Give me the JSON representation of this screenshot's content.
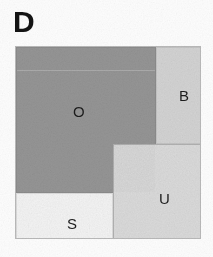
{
  "figure": {
    "panel_label": "D",
    "width": 213,
    "height": 257,
    "background_color": "#fdfdfd",
    "border_color": "#b9b9b9"
  },
  "chart_data": {
    "type": "treemap",
    "title": "D",
    "xlabel": "",
    "ylabel": "",
    "grid": false,
    "legend_position": "none",
    "plot_area": {
      "x": 15,
      "y": 46,
      "width": 186,
      "height": 193
    },
    "categories": [
      "O",
      "B",
      "U",
      "S"
    ],
    "values": [
      54.8,
      12.4,
      23.8,
      12.7
    ],
    "value_unit": "percent of area",
    "series": [
      {
        "name": "area share",
        "values": [
          54.8,
          12.4,
          23.8,
          12.7
        ]
      }
    ],
    "tiles": [
      {
        "label": "O",
        "value": 54.8,
        "color": "#969696",
        "border_color": "#8b8b8b",
        "x": 0,
        "y": 0,
        "width": 140,
        "height": 146,
        "label_x": 56,
        "label_y": 56
      },
      {
        "label": "B",
        "value": 12.4,
        "color": "#d5d5d5",
        "border_color": "#c2c2c2",
        "x": 140,
        "y": 0,
        "width": 46,
        "height": 97,
        "label_x": 22,
        "label_y": 40
      },
      {
        "label": "U",
        "value": 23.8,
        "color": "#dcdcdc",
        "border_color": "#b0b0b0",
        "x": 97,
        "y": 97,
        "width": 89,
        "height": 96,
        "label_x": 45,
        "label_y": 46
      },
      {
        "label": "S",
        "value": 12.7,
        "color": "#f5f5f5",
        "border_color": "#dadada",
        "x": 0,
        "y": 146,
        "width": 97,
        "height": 47,
        "label_x": 50,
        "label_y": 22
      }
    ],
    "annotations": [
      {
        "text": "D",
        "role": "panel-letter",
        "x": 13,
        "y": 6
      }
    ]
  }
}
